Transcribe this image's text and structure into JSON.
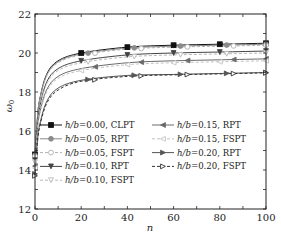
{
  "chart_data": {
    "type": "line",
    "title": "",
    "xlabel": "n",
    "ylabel": "ω0",
    "xlim": [
      0,
      100
    ],
    "ylim": [
      12,
      22
    ],
    "xticks": [
      0,
      20,
      40,
      60,
      80,
      100
    ],
    "xtick_labels": [
      "0",
      "20",
      "40",
      "60",
      "80",
      "100"
    ],
    "yticks": [
      12,
      14,
      16,
      18,
      20,
      22
    ],
    "ytick_labels": [
      "12",
      "14",
      "16",
      "18",
      "20",
      "22"
    ],
    "grid": false,
    "legend_position": "lower center, two columns",
    "x": [
      0,
      1,
      2,
      5,
      10,
      20,
      40,
      60,
      80,
      100
    ],
    "series": [
      {
        "name": "h/b=0.00, CLPT",
        "label_main": "h/b",
        "label_val": "=0.00, CLPT",
        "color": "#111111",
        "dash": "",
        "marker": "square-filled",
        "values": [
          14.8,
          16.6,
          17.6,
          18.9,
          19.6,
          20.0,
          20.3,
          20.4,
          20.45,
          20.5
        ]
      },
      {
        "name": "h/b=0.05, RPT",
        "label_main": "h/b",
        "label_val": "=0.05, RPT",
        "color": "#8a8a8a",
        "dash": "",
        "marker": "circle-filled",
        "values": [
          14.75,
          16.55,
          17.55,
          18.85,
          19.55,
          19.95,
          20.25,
          20.35,
          20.4,
          20.45
        ]
      },
      {
        "name": "h/b=0.05, FSPT",
        "label_main": "h/b",
        "label_val": "=0.05, FSPT",
        "color": "#b0b0b0",
        "dash": "3,2",
        "marker": "circle-open",
        "values": [
          14.7,
          16.5,
          17.5,
          18.8,
          19.5,
          19.9,
          20.2,
          20.3,
          20.35,
          20.4
        ]
      },
      {
        "name": "h/b=0.10, RPT",
        "label_main": "h/b",
        "label_val": "=0.10, RPT",
        "color": "#444444",
        "dash": "",
        "marker": "triangle-down-filled",
        "values": [
          14.5,
          16.3,
          17.2,
          18.5,
          19.2,
          19.6,
          19.9,
          20.0,
          20.05,
          20.1
        ]
      },
      {
        "name": "h/b=0.10, FSPT",
        "label_main": "h/b",
        "label_val": "=0.10, FSPT",
        "color": "#b8b8b8",
        "dash": "3,2",
        "marker": "triangle-down-open",
        "values": [
          14.4,
          16.2,
          17.1,
          18.4,
          19.1,
          19.5,
          19.8,
          19.9,
          19.95,
          20.0
        ]
      },
      {
        "name": "h/b=0.15, RPT",
        "label_main": "h/b",
        "label_val": "=0.15, RPT",
        "color": "#6a6a6a",
        "dash": "",
        "marker": "triangle-left-filled",
        "values": [
          14.2,
          16.0,
          16.9,
          18.1,
          18.8,
          19.2,
          19.5,
          19.6,
          19.65,
          19.7
        ]
      },
      {
        "name": "h/b=0.15, FSPT",
        "label_main": "h/b",
        "label_val": "=0.15, FSPT",
        "color": "#c4c4c4",
        "dash": "3,2",
        "marker": "triangle-left-open",
        "values": [
          14.1,
          15.9,
          16.8,
          18.0,
          18.7,
          19.1,
          19.4,
          19.5,
          19.55,
          19.6
        ]
      },
      {
        "name": "h/b=0.20, RPT",
        "label_main": "h/b",
        "label_val": "=0.20, RPT",
        "color": "#555555",
        "dash": "",
        "marker": "triangle-right-filled",
        "values": [
          13.8,
          15.4,
          16.3,
          17.5,
          18.2,
          18.6,
          18.85,
          18.9,
          18.95,
          19.0
        ]
      },
      {
        "name": "h/b=0.20, FSPT",
        "label_main": "h/b",
        "label_val": "=0.20, FSPT",
        "color": "#333333",
        "dash": "3,2",
        "marker": "triangle-right-open",
        "values": [
          13.7,
          15.3,
          16.2,
          17.4,
          18.1,
          18.55,
          18.8,
          18.88,
          18.93,
          18.98
        ]
      }
    ]
  }
}
